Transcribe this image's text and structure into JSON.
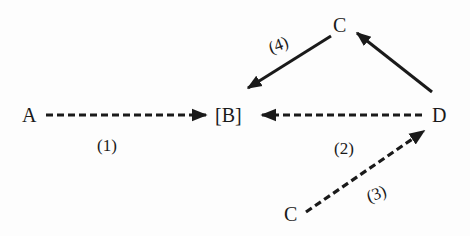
{
  "diagram": {
    "nodes": {
      "a": "A",
      "b": "[B]",
      "c_top": "C",
      "d": "D",
      "c_bottom": "C"
    },
    "edges": [
      {
        "from": "A",
        "to": "[B]",
        "style": "dashed",
        "label": "(1)"
      },
      {
        "from": "D",
        "to": "[B]",
        "style": "dashed",
        "label": "(2)"
      },
      {
        "from": "C",
        "to": "D",
        "style": "dashed",
        "label": "(3)"
      },
      {
        "from": "C",
        "to": "[B]",
        "style": "solid",
        "label": "(4)"
      },
      {
        "from": "D",
        "to": "C",
        "style": "solid",
        "label": ""
      }
    ],
    "labels": {
      "e1": "(1)",
      "e2": "(2)",
      "e3": "(3)",
      "e4": "(4)"
    },
    "colors": {
      "stroke": "#1a1a1a",
      "background": "#fdfdfd"
    }
  }
}
